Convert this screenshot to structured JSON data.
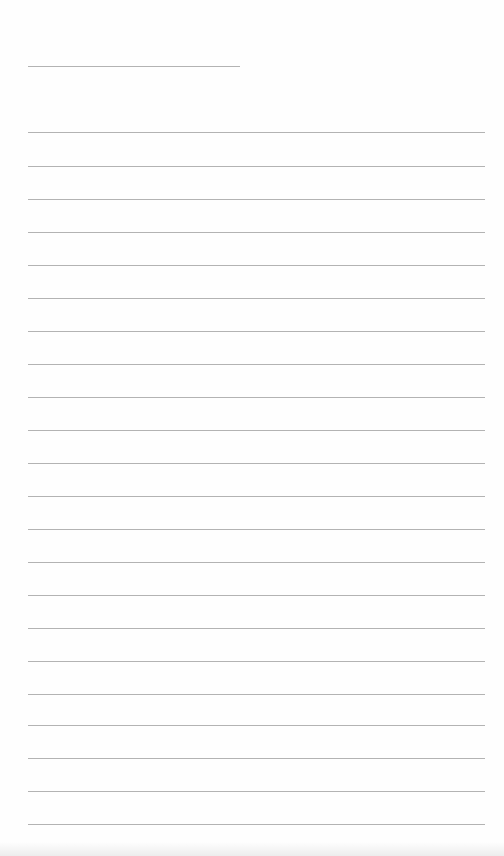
{
  "page": {
    "background": "#fefefe",
    "rule_color": "#9a9a9a",
    "short_rule": {
      "y": 66,
      "x1": 28,
      "x2": 240
    },
    "rules": {
      "x1": 28,
      "x2": 485,
      "y_values": [
        132,
        166,
        199,
        232,
        265,
        298,
        331,
        364,
        397,
        430,
        463,
        496,
        529,
        562,
        595,
        628,
        661,
        694,
        725,
        758,
        791,
        824
      ]
    }
  }
}
